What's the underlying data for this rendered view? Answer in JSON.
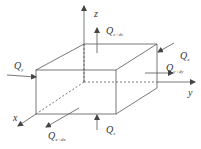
{
  "diagram": {
    "axes": {
      "x": "x",
      "y": "y",
      "z": "z"
    },
    "fluxes": {
      "q_z_dz": {
        "main": "Q",
        "sub": "z+dz"
      },
      "q_x": {
        "main": "Q",
        "sub": "x"
      },
      "q_y_dy": {
        "main": "Q",
        "sub": "y+dy"
      },
      "q_y": {
        "main": "Q",
        "sub": "y"
      },
      "q_x_dx": {
        "main": "Q",
        "sub": "x+dx"
      },
      "q_z": {
        "main": "Q",
        "sub": "z"
      }
    }
  }
}
